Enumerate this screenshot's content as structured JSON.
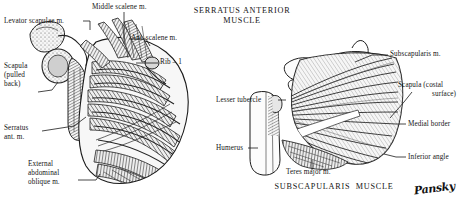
{
  "figure": {
    "kind": "anatomical-illustration",
    "background": "#ffffff",
    "ink": "#141414",
    "panels": [
      {
        "id": "left",
        "title": "",
        "subject": "Serratus anterior muscle, lateral view of thorax with scapula pulled back",
        "labels": [
          {
            "key": "levator_scapulae",
            "text": "Levator scapulae m."
          },
          {
            "key": "middle_scalene",
            "text": "Middle scalene m."
          },
          {
            "key": "ant_scalene",
            "text": "Ant. scalene m."
          },
          {
            "key": "rib_1",
            "text": "Rib – 1"
          },
          {
            "key": "scapula_pulled",
            "line1": "Scapula",
            "line2": "(pulled",
            "line3": "back)"
          },
          {
            "key": "serratus_ant",
            "line1": "Serratus",
            "line2": "ant. m."
          },
          {
            "key": "external_oblique",
            "line1": "External",
            "line2": "abdominal",
            "line3": "oblique m."
          }
        ]
      },
      {
        "id": "right",
        "title_line1": "SERRATUS ANTERIOR",
        "title_line2": "MUSCLE",
        "caption": "SUBSCAPULARIS  MUSCLE",
        "subject": "Subscapularis muscle on costal surface of scapula",
        "labels": [
          {
            "key": "subscapularis",
            "text": "Subscapularis m."
          },
          {
            "key": "scapula_costal",
            "line1": "Scapula (costal",
            "line2": "surface)"
          },
          {
            "key": "medial_border",
            "text": "Medial border"
          },
          {
            "key": "inferior_angle",
            "text": "Inferior angle"
          },
          {
            "key": "lesser_tubercle",
            "text": "Lesser tubercle"
          },
          {
            "key": "humerus",
            "text": "Humerus"
          },
          {
            "key": "teres_major",
            "text": "Teres major m."
          }
        ]
      }
    ],
    "signature": "Pansky"
  }
}
